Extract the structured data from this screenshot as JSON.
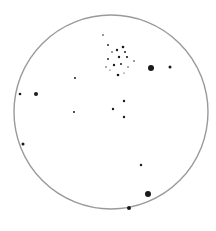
{
  "sketch": {
    "subject": "Telescope eyepiece field sketch",
    "background_color": "#ffffff",
    "field_circle": {
      "cx": 111,
      "cy": 112,
      "r": 97,
      "stroke": "#9a9a9a"
    },
    "stars": [
      {
        "x": 151,
        "y": 68,
        "r": 3.0
      },
      {
        "x": 148,
        "y": 194,
        "r": 3.0
      },
      {
        "x": 129,
        "y": 208,
        "r": 2.0
      },
      {
        "x": 36,
        "y": 94,
        "r": 2.0
      },
      {
        "x": 170,
        "y": 67,
        "r": 1.5
      },
      {
        "x": 20,
        "y": 94,
        "r": 1.3
      },
      {
        "x": 23,
        "y": 144,
        "r": 1.5
      },
      {
        "x": 75,
        "y": 78,
        "r": 1.0
      },
      {
        "x": 74,
        "y": 112,
        "r": 1.0
      },
      {
        "x": 113,
        "y": 109,
        "r": 1.2
      },
      {
        "x": 124,
        "y": 101,
        "r": 1.2
      },
      {
        "x": 124,
        "y": 117,
        "r": 1.2
      },
      {
        "x": 141,
        "y": 165,
        "r": 1.2
      },
      {
        "x": 103,
        "y": 35,
        "r": 0.8
      },
      {
        "x": 108,
        "y": 45,
        "r": 0.9
      },
      {
        "x": 117,
        "y": 50,
        "r": 1.2
      },
      {
        "x": 123,
        "y": 47,
        "r": 1.3
      },
      {
        "x": 125,
        "y": 52,
        "r": 1.0
      },
      {
        "x": 112,
        "y": 52,
        "r": 0.8
      },
      {
        "x": 119,
        "y": 57,
        "r": 1.2
      },
      {
        "x": 127,
        "y": 57,
        "r": 1.1
      },
      {
        "x": 108,
        "y": 59,
        "r": 0.9
      },
      {
        "x": 114,
        "y": 65,
        "r": 1.2
      },
      {
        "x": 121,
        "y": 64,
        "r": 1.0
      },
      {
        "x": 128,
        "y": 67,
        "r": 0.7
      },
      {
        "x": 134,
        "y": 61,
        "r": 0.8
      },
      {
        "x": 106,
        "y": 67,
        "r": 0.7
      },
      {
        "x": 118,
        "y": 75,
        "r": 1.3
      },
      {
        "x": 110,
        "y": 70,
        "r": 0.6
      },
      {
        "x": 124,
        "y": 73,
        "r": 0.6
      }
    ],
    "star_color": "#1a1a1a"
  }
}
